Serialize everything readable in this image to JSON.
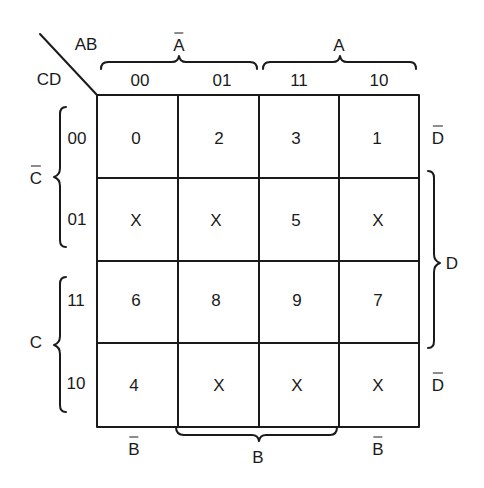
{
  "kmap": {
    "corner": {
      "row_vars": "AB",
      "col_vars": "CD"
    },
    "column_header": {
      "group_labels": [
        {
          "text": "A",
          "overbar": true,
          "spans": [
            "00",
            "01"
          ]
        },
        {
          "text": "A",
          "overbar": false,
          "spans": [
            "11",
            "10"
          ]
        }
      ],
      "codes": [
        "00",
        "01",
        "11",
        "10"
      ]
    },
    "row_header": {
      "group_labels": [
        {
          "text": "C",
          "overbar": true,
          "spans": [
            "00",
            "01"
          ]
        },
        {
          "text": "C",
          "overbar": false,
          "spans": [
            "11",
            "10"
          ]
        }
      ],
      "codes": [
        "00",
        "01",
        "11",
        "10"
      ]
    },
    "right_labels": [
      {
        "text": "D",
        "overbar": true,
        "row": "00"
      },
      {
        "text": "D",
        "overbar": false,
        "rows": [
          "01",
          "11"
        ]
      },
      {
        "text": "D",
        "overbar": true,
        "row": "10"
      }
    ],
    "bottom_labels": [
      {
        "text": "B",
        "overbar": true,
        "column": "00"
      },
      {
        "text": "B",
        "overbar": false,
        "columns": [
          "01",
          "11"
        ]
      },
      {
        "text": "B",
        "overbar": true,
        "column": "10"
      }
    ],
    "cells": [
      [
        "0",
        "2",
        "3",
        "1"
      ],
      [
        "X",
        "X",
        "5",
        "X"
      ],
      [
        "6",
        "8",
        "9",
        "7"
      ],
      [
        "4",
        "X",
        "X",
        "X"
      ]
    ],
    "line_color": "#1a1a1a"
  }
}
